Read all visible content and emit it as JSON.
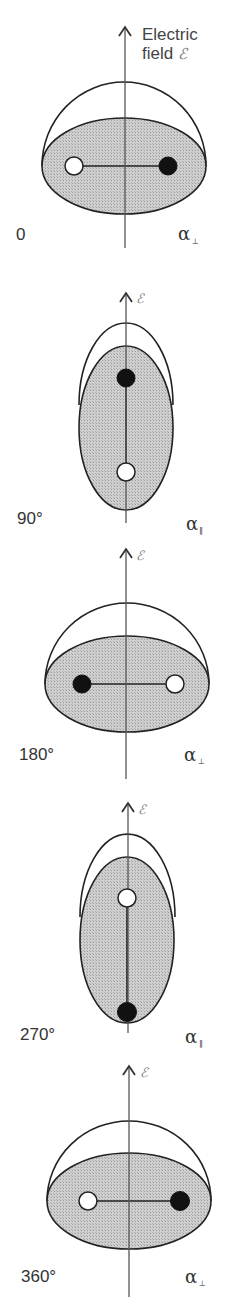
{
  "title_label": {
    "line1": "Electric",
    "line2": "field",
    "symbol": "ℰ"
  },
  "field_symbol": "ℰ",
  "colors": {
    "shade": "#c8c8c8",
    "stroke": "#222222",
    "axis": "#555555",
    "filled_atom": "#111111",
    "open_atom": "#ffffff"
  },
  "panels": [
    {
      "angle": "0",
      "polarizability": "α",
      "sub": "⊥",
      "orientation": "horizontal",
      "open_side": "left"
    },
    {
      "angle": "90°",
      "polarizability": "α",
      "sub": "∥",
      "orientation": "vertical",
      "open_side": "bottom"
    },
    {
      "angle": "180°",
      "polarizability": "α",
      "sub": "⊥",
      "orientation": "horizontal",
      "open_side": "right"
    },
    {
      "angle": "270°",
      "polarizability": "α",
      "sub": "∥",
      "orientation": "vertical",
      "open_side": "top"
    },
    {
      "angle": "360°",
      "polarizability": "α",
      "sub": "⊥",
      "orientation": "horizontal",
      "open_side": "left"
    }
  ]
}
